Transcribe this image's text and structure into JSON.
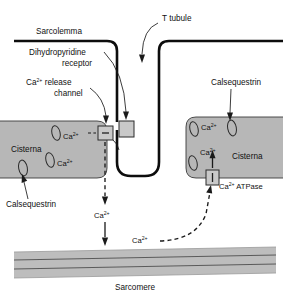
{
  "figure": {
    "width": 283,
    "height": 294
  },
  "colors": {
    "background": "#ffffff",
    "membrane": "#0d0d0d",
    "cisterna_fill": "#b7b7b7",
    "cisterna_stroke": "#3a3a3a",
    "channel_fill": "#c9c9c9",
    "sarcomere_fill": "#bdbdbd",
    "sarcomere_line": "#5a5a5a",
    "text": "#111111"
  },
  "labels": {
    "sarcolemma": "Sarcolemma",
    "t_tubule": "T tubule",
    "dihydropyridine_receptor_line1": "Dihydropyridine",
    "dihydropyridine_receptor_line2": "receptor",
    "ca_release_channel_line1_prefix": "Ca",
    "ca_release_channel_line1_sup": "2+",
    "ca_release_channel_line1_suffix": " release",
    "ca_release_channel_line2": "channel",
    "calsequestrin_left": "Calsequestrin",
    "calsequestrin_right": "Calsequestrin",
    "cisterna_left": "Cisterna",
    "cisterna_right": "Cisterna",
    "sarcomere": "Sarcomere",
    "ca_atpase_prefix": "Ca",
    "ca_atpase_sup": "2+",
    "ca_atpase_suffix": " ATPase"
  },
  "ions": {
    "symbol_base": "Ca",
    "symbol_sup": "2+",
    "occurrences": [
      {
        "name": "ca-left-cisterna-upper",
        "x": 63,
        "y": 136
      },
      {
        "name": "ca-left-cisterna-lower",
        "x": 63,
        "y": 158
      },
      {
        "name": "ca-cytosol-upper",
        "x": 101,
        "y": 216
      },
      {
        "name": "ca-cytosol-lower",
        "x": 139,
        "y": 240
      },
      {
        "name": "ca-right-cisterna-top",
        "x": 201,
        "y": 124
      },
      {
        "name": "ca-right-cisterna-mid",
        "x": 200,
        "y": 152
      }
    ]
  },
  "structures": {
    "sarcolemma_label_pos": {
      "x": 37,
      "y": 33
    },
    "t_tubule_label_pos": {
      "x": 163,
      "y": 19
    },
    "left_cisterna_label_pos": {
      "x": 12,
      "y": 150
    },
    "right_cisterna_label_pos": {
      "x": 233,
      "y": 157
    },
    "sarcomere_label_pos": {
      "x": 116,
      "y": 288
    }
  },
  "flows": [
    {
      "name": "ca-release-flow",
      "style": "dashed",
      "from": "left-cisterna-release-channel",
      "to": "sarcomere"
    },
    {
      "name": "ca-reuptake-flow",
      "style": "dashed",
      "from": "sarcomere",
      "to": "ca-atpase"
    },
    {
      "name": "ca-atpase-uptake",
      "style": "solid",
      "from": "ca-atpase",
      "to": "right-cisterna"
    }
  ]
}
